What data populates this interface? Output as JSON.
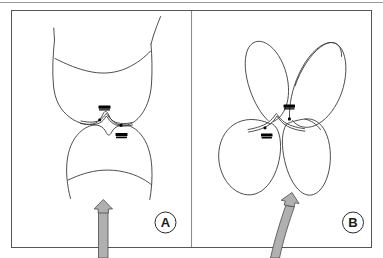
{
  "figure": {
    "width": 383,
    "height": 258,
    "background_color": "#ffffff",
    "outer_border_color": "#9a9a9a",
    "panel_border_color": "#555555",
    "divider_color": "#8d8d8d",
    "line_color": "#3a3a3a",
    "marker_color": "#000000",
    "arrow_fill_color": "#b0b0b0",
    "arrow_stroke_color": "#4a4a4a"
  },
  "panels": [
    {
      "id": "A",
      "label": "A",
      "label_shape": "circle",
      "description": "Two opposing curved organic structures separated by a narrow V-shaped cleft, with a straight vertical arrow approaching from below",
      "arrow": {
        "name": "straight-arrow",
        "orientation": "vertical",
        "direction": "up"
      },
      "markers": [
        {
          "type": "dash",
          "name": "upper-dash-marker"
        },
        {
          "type": "dot",
          "name": "left-dot-marker"
        },
        {
          "type": "dot",
          "name": "right-dot-marker"
        },
        {
          "type": "dash",
          "name": "lower-dash-marker"
        }
      ]
    },
    {
      "id": "B",
      "label": "B",
      "label_shape": "circle",
      "description": "Four rounded lobed structures arranged around a central cleft, with a curved arrow approaching from lower left",
      "arrow": {
        "name": "curved-arrow",
        "orientation": "diagonal",
        "direction": "up"
      },
      "markers": [
        {
          "type": "dash",
          "name": "upper-dash-marker"
        },
        {
          "type": "dot",
          "name": "right-dot-marker"
        },
        {
          "type": "dot",
          "name": "left-dot-marker"
        },
        {
          "type": "dash",
          "name": "lower-dash-marker"
        }
      ]
    }
  ]
}
